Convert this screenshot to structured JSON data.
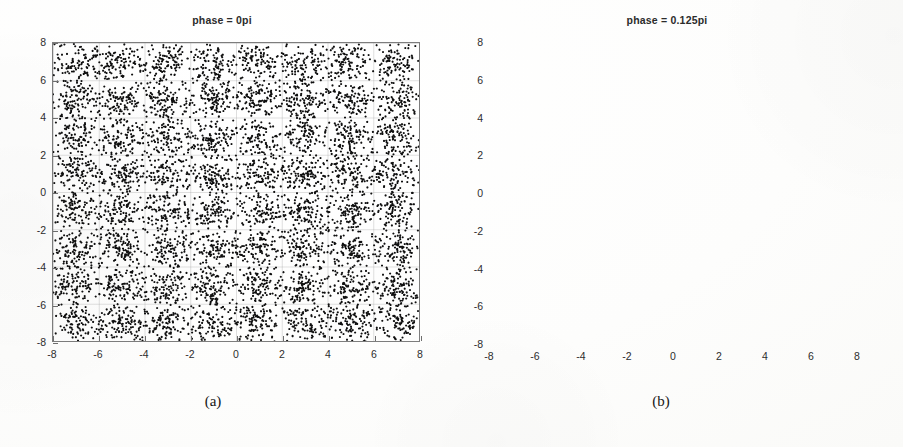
{
  "figure": {
    "panels": [
      {
        "id": "a",
        "caption": "(a)",
        "title": "phase = 0pi"
      },
      {
        "id": "b",
        "caption": "(b)",
        "title": "phase = 0.125pi"
      }
    ]
  },
  "chart_data": [
    {
      "type": "scatter",
      "title": "phase = 0pi",
      "xlabel": "",
      "ylabel": "",
      "xlim": [
        -8,
        8
      ],
      "ylim": [
        -8,
        8
      ],
      "xticks": [
        -8,
        -6,
        -4,
        -2,
        0,
        2,
        4,
        6,
        8
      ],
      "yticks": [
        -8,
        -6,
        -4,
        -2,
        0,
        2,
        4,
        6,
        8
      ],
      "xticklabels": [
        "-8",
        "-6",
        "-4",
        "-2",
        "0",
        "2",
        "4",
        "6",
        "8"
      ],
      "yticklabels": [
        "-8",
        "-6",
        "-4",
        "-2",
        "0",
        "2",
        "4",
        "6",
        "8"
      ],
      "grid": true,
      "legend": null,
      "marker": "dot",
      "marker_color": "#101010",
      "description": "64-QAM constellation with additive noise; 8x8 grid of point clusters centred on odd integer coordinates.",
      "cluster_centers_x": [
        -7,
        -5,
        -3,
        -1,
        1,
        3,
        5,
        7
      ],
      "cluster_centers_y": [
        -7,
        -5,
        -3,
        -1,
        1,
        3,
        5,
        7
      ],
      "cluster_count": 64,
      "points_per_cluster": 110,
      "cluster_sigma": 0.55,
      "total_points": 7040,
      "rotation_rad": 0
    },
    {
      "type": "scatter",
      "title": "phase = 0.125pi",
      "xlabel": "",
      "ylabel": "",
      "xlim": [
        -8,
        8
      ],
      "ylim": [
        -8,
        8
      ],
      "xticks": [
        -8,
        -6,
        -4,
        -2,
        0,
        2,
        4,
        6,
        8
      ],
      "yticks": [
        -8,
        -6,
        -4,
        -2,
        0,
        2,
        4,
        6,
        8
      ],
      "xticklabels": [
        "-8",
        "-6",
        "-4",
        "-2",
        "0",
        "2",
        "4",
        "6",
        "8"
      ],
      "yticklabels": [
        "-8",
        "-6",
        "-4",
        "-2",
        "0",
        "2",
        "4",
        "6",
        "8"
      ],
      "grid": true,
      "legend": null,
      "marker": "dot",
      "marker_color": "#101010",
      "description": "Same 64-QAM constellation smeared by a random phase rotation spanning 0.125pi; clusters merge into one dense circular cloud.",
      "cluster_centers_x": [
        -7,
        -5,
        -3,
        -1,
        1,
        3,
        5,
        7
      ],
      "cluster_centers_y": [
        -7,
        -5,
        -3,
        -1,
        1,
        3,
        5,
        7
      ],
      "cluster_count": 64,
      "points_per_cluster": 110,
      "cluster_sigma": 0.45,
      "total_points": 7040,
      "rotation_rad": 0.39269908
    }
  ]
}
